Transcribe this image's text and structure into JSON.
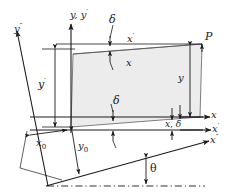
{
  "figure": {
    "type": "technical-line-diagram",
    "background_color": "#ffffff",
    "line_color": "#1a1a1a",
    "fill_color": "#ececec"
  },
  "axes": [
    {
      "id": "y-yprime",
      "label_plain": "y, y'",
      "base": "y, y",
      "prime": "′",
      "orientation": "vertical-up"
    },
    {
      "id": "ydoubleprime",
      "label_plain": "y\"",
      "base": "y",
      "prime": "″",
      "orientation": "up-left"
    },
    {
      "id": "x",
      "label_plain": "x",
      "base": "x",
      "prime": "",
      "orientation": "right"
    },
    {
      "id": "xprime",
      "label_plain": "x'",
      "base": "x",
      "prime": "′",
      "orientation": "right"
    },
    {
      "id": "xdoubleprime",
      "label_plain": "x\"",
      "base": "x",
      "prime": "″",
      "orientation": "right-up"
    }
  ],
  "labels": {
    "point_p": "P",
    "theta": "θ",
    "delta_top": "δ",
    "delta_mid": "δ",
    "delta_bottom": "δ",
    "x_prime_top": {
      "base": "x",
      "prime": "′"
    },
    "x_top": "x",
    "y_right": "y",
    "y_prime_left": {
      "base": "y",
      "prime": "′"
    },
    "x_zero": {
      "base": "x",
      "sub": "0"
    },
    "y_zero": {
      "base": "y",
      "sub": "0"
    },
    "x_delta": {
      "base": "x,",
      "delta": "δ"
    }
  },
  "geometry": {
    "origin": {
      "x": 71,
      "y": 127
    },
    "quad_vertices": [
      {
        "x": 71,
        "y": 127
      },
      {
        "x": 200,
        "y": 117
      },
      {
        "x": 202,
        "y": 44
      },
      {
        "x": 73,
        "y": 54
      }
    ],
    "angle_theta_degrees": 12
  }
}
